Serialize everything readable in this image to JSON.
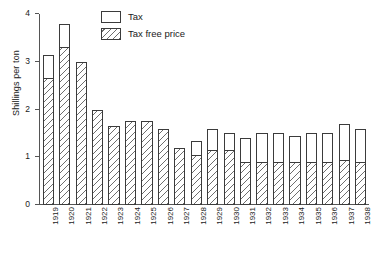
{
  "chart_data": {
    "type": "bar",
    "title": "",
    "subtitle": "",
    "xlabel": "",
    "ylabel": "Shillings per ton",
    "stacked": true,
    "grid": false,
    "legend_position": "top-center",
    "ylim": [
      0,
      4
    ],
    "yticks": [
      0,
      1,
      2,
      3,
      4
    ],
    "ytick_labels": [
      "0",
      "1",
      "2",
      "3",
      "4"
    ],
    "categories": [
      "1919",
      "1920",
      "1921",
      "1922",
      "1923",
      "1924",
      "1925",
      "1926",
      "1927",
      "1928",
      "1929",
      "1930",
      "1931",
      "1932",
      "1933",
      "1934",
      "1935",
      "1936",
      "1937",
      "1938"
    ],
    "series": [
      {
        "name": "Tax free price",
        "values": [
          2.65,
          3.3,
          3.0,
          2.0,
          1.65,
          1.75,
          1.75,
          1.6,
          1.2,
          1.05,
          1.15,
          1.15,
          0.9,
          0.9,
          0.9,
          0.9,
          0.9,
          0.9,
          0.95,
          0.9
        ]
      },
      {
        "name": "Tax",
        "values": [
          0.5,
          0.5,
          0.0,
          0.0,
          0.0,
          0.0,
          0.0,
          0.0,
          0.0,
          0.3,
          0.45,
          0.35,
          0.5,
          0.6,
          0.6,
          0.55,
          0.6,
          0.6,
          0.75,
          0.7
        ]
      }
    ],
    "totals": [
      3.15,
      3.8,
      3.0,
      2.0,
      1.65,
      1.75,
      1.75,
      1.6,
      1.2,
      1.35,
      1.6,
      1.5,
      1.4,
      1.5,
      1.5,
      1.45,
      1.5,
      1.5,
      1.7,
      1.6
    ]
  },
  "legend": {
    "items": [
      {
        "label": "Tax",
        "pattern": "solid-white"
      },
      {
        "label": "Tax free price",
        "pattern": "diagonal-hatch"
      }
    ]
  },
  "colors": {
    "bar_outline": "#3b3b3b",
    "hatch": "#6e6e6e",
    "axis": "#555555",
    "text": "#1a1a1a",
    "background": "#ffffff"
  }
}
